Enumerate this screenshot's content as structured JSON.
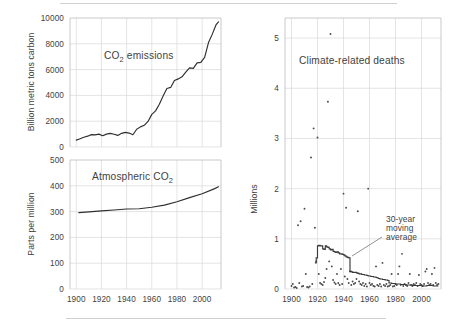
{
  "figure": {
    "background": "#ffffff",
    "ink_color": "#2f2f31",
    "grid_color": "#d8d8dc",
    "frame_color": "#bdbdc2"
  },
  "chart_data": [
    {
      "type": "line",
      "id": "co2-emissions",
      "title": "CO2 emissions",
      "title_display": "CO₂ emissions",
      "xlabel": "",
      "ylabel": "Billion metric tons carbon",
      "xlim": [
        1895,
        2015
      ],
      "ylim": [
        0,
        10000
      ],
      "yticks": [
        0,
        2000,
        4000,
        6000,
        8000,
        10000
      ],
      "ytick_labels": [
        "0",
        "2000",
        "4000",
        "6000",
        "8000",
        "10000"
      ],
      "xticks": [
        1900,
        1920,
        1940,
        1960,
        1980,
        2000
      ],
      "xtick_labels": [
        "1900",
        "1920",
        "1940",
        "1960",
        "1980",
        "2000"
      ],
      "grid": true,
      "legend": "none",
      "x": [
        1900,
        1903,
        1906,
        1909,
        1912,
        1915,
        1918,
        1921,
        1924,
        1927,
        1930,
        1933,
        1936,
        1939,
        1942,
        1945,
        1948,
        1951,
        1954,
        1957,
        1960,
        1963,
        1966,
        1969,
        1972,
        1975,
        1978,
        1981,
        1984,
        1987,
        1990,
        1993,
        1996,
        1999,
        2002,
        2005,
        2008,
        2011,
        2013
      ],
      "values": [
        534,
        640,
        760,
        840,
        960,
        940,
        1000,
        870,
        1000,
        1060,
        990,
        900,
        1060,
        1130,
        1080,
        950,
        1380,
        1560,
        1680,
        1980,
        2530,
        2800,
        3320,
        3950,
        4530,
        4620,
        5160,
        5280,
        5440,
        5800,
        6130,
        6100,
        6520,
        6560,
        6940,
        8080,
        8730,
        9460,
        9700
      ]
    },
    {
      "type": "line",
      "id": "atmospheric-co2",
      "title": "Atmospheric CO2",
      "title_display": "Atmospheric CO₂",
      "xlabel": "",
      "ylabel": "Parts per million",
      "xlim": [
        1895,
        2015
      ],
      "ylim": [
        0,
        500
      ],
      "yticks": [
        0,
        100,
        200,
        300,
        400,
        500
      ],
      "ytick_labels": [
        "0",
        "100",
        "200",
        "300",
        "400",
        "500"
      ],
      "xticks": [
        1900,
        1920,
        1940,
        1960,
        1980,
        2000
      ],
      "xtick_labels": [
        "1900",
        "1920",
        "1940",
        "1960",
        "1980",
        "2000"
      ],
      "grid": true,
      "legend": "none",
      "x": [
        1902,
        1910,
        1920,
        1930,
        1940,
        1950,
        1960,
        1970,
        1980,
        1990,
        2000,
        2010,
        2013
      ],
      "values": [
        296,
        299,
        303,
        306,
        310,
        311,
        317,
        325,
        338,
        354,
        369,
        389,
        396
      ]
    },
    {
      "type": "scatter",
      "id": "climate-related-deaths",
      "title": "Climate-related deaths",
      "xlabel": "",
      "ylabel": "Millions",
      "xlim": [
        1895,
        2015
      ],
      "ylim": [
        0,
        5.4
      ],
      "yticks": [
        0,
        1,
        2,
        3,
        4,
        5
      ],
      "ytick_labels": [
        "0",
        "1",
        "2",
        "3",
        "4",
        "5"
      ],
      "xticks": [
        1900,
        1920,
        1940,
        1960,
        1980,
        2000
      ],
      "xtick_labels": [
        "1900",
        "1920",
        "1940",
        "1960",
        "1980",
        "2000"
      ],
      "grid": true,
      "legend": "none",
      "annotations": [
        {
          "text": "30-year moving average",
          "lines": [
            "30-year",
            "moving",
            "average"
          ],
          "points_to_series": "30-year moving average"
        }
      ],
      "points": [
        [
          1900,
          0.06
        ],
        [
          1901,
          0.1
        ],
        [
          1902,
          0.03
        ],
        [
          1903,
          0.04
        ],
        [
          1904,
          0.02
        ],
        [
          1905,
          1.27
        ],
        [
          1906,
          0.12
        ],
        [
          1907,
          1.35
        ],
        [
          1908,
          0.05
        ],
        [
          1909,
          0.06
        ],
        [
          1910,
          1.6
        ],
        [
          1911,
          0.3
        ],
        [
          1912,
          0.04
        ],
        [
          1913,
          0.03
        ],
        [
          1914,
          0.05
        ],
        [
          1915,
          2.62
        ],
        [
          1916,
          0.1
        ],
        [
          1917,
          3.2
        ],
        [
          1918,
          1.22
        ],
        [
          1919,
          0.55
        ],
        [
          1920,
          3.02
        ],
        [
          1921,
          0.3
        ],
        [
          1922,
          0.12
        ],
        [
          1923,
          0.1
        ],
        [
          1924,
          0.08
        ],
        [
          1925,
          0.14
        ],
        [
          1926,
          0.22
        ],
        [
          1927,
          0.4
        ],
        [
          1928,
          3.73
        ],
        [
          1929,
          0.55
        ],
        [
          1930,
          5.08
        ],
        [
          1931,
          0.45
        ],
        [
          1932,
          0.18
        ],
        [
          1933,
          0.13
        ],
        [
          1934,
          0.1
        ],
        [
          1935,
          0.3
        ],
        [
          1936,
          0.12
        ],
        [
          1937,
          0.08
        ],
        [
          1938,
          0.4
        ],
        [
          1939,
          0.1
        ],
        [
          1940,
          1.9
        ],
        [
          1941,
          0.25
        ],
        [
          1942,
          1.62
        ],
        [
          1943,
          0.2
        ],
        [
          1944,
          0.12
        ],
        [
          1945,
          0.35
        ],
        [
          1946,
          0.08
        ],
        [
          1947,
          0.15
        ],
        [
          1948,
          0.1
        ],
        [
          1949,
          0.12
        ],
        [
          1950,
          0.2
        ],
        [
          1951,
          1.55
        ],
        [
          1952,
          0.15
        ],
        [
          1953,
          0.1
        ],
        [
          1954,
          0.08
        ],
        [
          1955,
          0.12
        ],
        [
          1956,
          0.06
        ],
        [
          1957,
          0.1
        ],
        [
          1958,
          0.05
        ],
        [
          1959,
          2.0
        ],
        [
          1960,
          0.12
        ],
        [
          1961,
          0.08
        ],
        [
          1962,
          0.1
        ],
        [
          1963,
          0.06
        ],
        [
          1964,
          0.05
        ],
        [
          1965,
          0.45
        ],
        [
          1966,
          0.08
        ],
        [
          1967,
          0.06
        ],
        [
          1968,
          0.1
        ],
        [
          1969,
          0.05
        ],
        [
          1970,
          0.52
        ],
        [
          1971,
          0.08
        ],
        [
          1972,
          0.06
        ],
        [
          1973,
          0.1
        ],
        [
          1974,
          0.05
        ],
        [
          1975,
          0.06
        ],
        [
          1976,
          0.08
        ],
        [
          1977,
          0.3
        ],
        [
          1978,
          0.05
        ],
        [
          1979,
          0.06
        ],
        [
          1980,
          0.1
        ],
        [
          1981,
          0.08
        ],
        [
          1982,
          0.3
        ],
        [
          1983,
          0.45
        ],
        [
          1984,
          0.08
        ],
        [
          1985,
          0.7
        ],
        [
          1986,
          0.06
        ],
        [
          1987,
          0.1
        ],
        [
          1988,
          0.08
        ],
        [
          1989,
          0.06
        ],
        [
          1990,
          0.12
        ],
        [
          1991,
          0.3
        ],
        [
          1992,
          0.08
        ],
        [
          1993,
          0.06
        ],
        [
          1994,
          0.1
        ],
        [
          1995,
          0.08
        ],
        [
          1996,
          0.12
        ],
        [
          1997,
          0.06
        ],
        [
          1998,
          0.28
        ],
        [
          1999,
          0.1
        ],
        [
          2000,
          0.08
        ],
        [
          2001,
          0.06
        ],
        [
          2002,
          0.1
        ],
        [
          2003,
          0.35
        ],
        [
          2004,
          0.4
        ],
        [
          2005,
          0.12
        ],
        [
          2006,
          0.08
        ],
        [
          2007,
          0.1
        ],
        [
          2008,
          0.3
        ],
        [
          2009,
          0.08
        ],
        [
          2010,
          0.42
        ],
        [
          2011,
          0.12
        ],
        [
          2012,
          0.08
        ],
        [
          2013,
          0.1
        ]
      ],
      "moving_average": {
        "name": "30-year moving average",
        "window_years": 30,
        "x": [
          1918,
          1919,
          1920,
          1921,
          1922,
          1923,
          1924,
          1925,
          1926,
          1927,
          1928,
          1929,
          1930,
          1931,
          1932,
          1933,
          1934,
          1935,
          1936,
          1937,
          1938,
          1939,
          1940,
          1941,
          1942,
          1943,
          1944,
          1945,
          1946,
          1947,
          1948,
          1949,
          1950,
          1951,
          1952,
          1953,
          1954,
          1955,
          1956,
          1957,
          1958,
          1959,
          1960,
          1961,
          1962,
          1963,
          1964,
          1965,
          1966,
          1967,
          1968,
          1969,
          1970,
          1971,
          1972,
          1973,
          1974,
          1975,
          1976,
          1977,
          1978,
          1979,
          1980,
          1981,
          1982,
          1983,
          1984,
          1985,
          1986,
          1987,
          1988,
          1989,
          1990,
          1991,
          1992,
          1993,
          1994,
          1995,
          1996,
          1997,
          1998,
          1999,
          2000,
          2001,
          2002,
          2003,
          2004,
          2005,
          2006,
          2007,
          2008,
          2009,
          2010,
          2011,
          2012,
          2013
        ],
        "values": [
          0.52,
          0.62,
          0.86,
          0.87,
          0.86,
          0.86,
          0.8,
          0.79,
          0.86,
          0.84,
          0.83,
          0.8,
          0.78,
          0.79,
          0.75,
          0.74,
          0.73,
          0.74,
          0.72,
          0.7,
          0.7,
          0.69,
          0.68,
          0.66,
          0.64,
          0.63,
          0.62,
          0.35,
          0.34,
          0.33,
          0.33,
          0.33,
          0.32,
          0.31,
          0.3,
          0.3,
          0.29,
          0.29,
          0.28,
          0.28,
          0.27,
          0.26,
          0.26,
          0.25,
          0.25,
          0.24,
          0.24,
          0.23,
          0.22,
          0.21,
          0.2,
          0.2,
          0.19,
          0.19,
          0.18,
          0.18,
          0.17,
          0.12,
          0.12,
          0.11,
          0.11,
          0.11,
          0.1,
          0.1,
          0.1,
          0.1,
          0.09,
          0.09,
          0.09,
          0.09,
          0.08,
          0.08,
          0.08,
          0.08,
          0.08,
          0.07,
          0.07,
          0.07,
          0.07,
          0.07,
          0.07,
          0.07,
          0.06,
          0.06,
          0.06,
          0.06,
          0.07,
          0.07,
          0.07,
          0.07,
          0.07,
          0.06,
          0.06,
          0.06,
          0.06,
          0.06
        ]
      }
    }
  ]
}
